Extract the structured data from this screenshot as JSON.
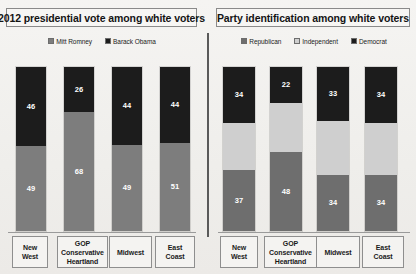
{
  "chart_data": [
    {
      "type": "bar",
      "subtype": "stacked-100",
      "title": "2012 presidential vote among white voters",
      "xlabel": "",
      "ylabel": "",
      "ylim": [
        0,
        100
      ],
      "grid": false,
      "legend_position": "top-center",
      "categories": [
        "New West",
        "GOP Conservative Heartland",
        "Midwest",
        "East Coast"
      ],
      "series": [
        {
          "name": "Mitt Romney",
          "color": "#7d7d7d",
          "values": [
            49,
            68,
            49,
            51
          ]
        },
        {
          "name": "Barack Obama",
          "color": "#1c1c1c",
          "values": [
            46,
            26,
            44,
            44
          ]
        }
      ],
      "stack_order_top_to_bottom": [
        "Barack Obama",
        "Mitt Romney"
      ]
    },
    {
      "type": "bar",
      "subtype": "stacked-100",
      "title": "Party identification among white voters",
      "xlabel": "",
      "ylabel": "",
      "ylim": [
        0,
        100
      ],
      "grid": false,
      "legend_position": "top-center",
      "categories": [
        "New West",
        "GOP Conservative Heartland",
        "Midwest",
        "East Coast"
      ],
      "series": [
        {
          "name": "Republican",
          "color": "#6e6e6e",
          "values": [
            37,
            48,
            34,
            34
          ]
        },
        {
          "name": "Independent",
          "color": "#cfcfcf",
          "values": [
            29,
            30,
            33,
            32
          ]
        },
        {
          "name": "Democrat",
          "color": "#1c1c1c",
          "values": [
            34,
            22,
            33,
            34
          ]
        }
      ],
      "stack_order_top_to_bottom": [
        "Democrat",
        "Independent",
        "Republican"
      ]
    }
  ],
  "panels": [
    {
      "title": "2012 presidential vote among white voters",
      "legend": [
        {
          "label": "Mitt Romney",
          "color": "#7d7d7d"
        },
        {
          "label": "Barack Obama",
          "color": "#1c1c1c"
        }
      ],
      "bars": [
        {
          "category_lines": [
            "New",
            "West"
          ],
          "segments": [
            {
              "series": "Barack Obama",
              "value": 46,
              "label": "46",
              "color": "#1c1c1c",
              "tone": "dark"
            },
            {
              "series": "Mitt Romney",
              "value": 49,
              "label": "49",
              "color": "#7d7d7d",
              "tone": "mid"
            }
          ]
        },
        {
          "category_lines": [
            "GOP",
            "Conservative",
            "Heartland"
          ],
          "segments": [
            {
              "series": "Barack Obama",
              "value": 26,
              "label": "26",
              "color": "#1c1c1c",
              "tone": "dark"
            },
            {
              "series": "Mitt Romney",
              "value": 68,
              "label": "68",
              "color": "#7d7d7d",
              "tone": "mid"
            }
          ]
        },
        {
          "category_lines": [
            "Midwest"
          ],
          "segments": [
            {
              "series": "Barack Obama",
              "value": 44,
              "label": "44",
              "color": "#1c1c1c",
              "tone": "dark"
            },
            {
              "series": "Mitt Romney",
              "value": 49,
              "label": "49",
              "color": "#7d7d7d",
              "tone": "mid"
            }
          ]
        },
        {
          "category_lines": [
            "East",
            "Coast"
          ],
          "segments": [
            {
              "series": "Barack Obama",
              "value": 44,
              "label": "44",
              "color": "#1c1c1c",
              "tone": "dark"
            },
            {
              "series": "Mitt Romney",
              "value": 51,
              "label": "51",
              "color": "#7d7d7d",
              "tone": "mid"
            }
          ]
        }
      ]
    },
    {
      "title": "Party identification among white voters",
      "legend": [
        {
          "label": "Republican",
          "color": "#6e6e6e"
        },
        {
          "label": "Independent",
          "color": "#cfcfcf"
        },
        {
          "label": "Democrat",
          "color": "#1c1c1c"
        }
      ],
      "bars": [
        {
          "category_lines": [
            "New",
            "West"
          ],
          "segments": [
            {
              "series": "Democrat",
              "value": 34,
              "label": "34",
              "color": "#1c1c1c",
              "tone": "dark"
            },
            {
              "series": "Independent",
              "value": 29,
              "label": "",
              "color": "#cfcfcf",
              "tone": "light"
            },
            {
              "series": "Republican",
              "value": 37,
              "label": "37",
              "color": "#6e6e6e",
              "tone": "mid"
            }
          ]
        },
        {
          "category_lines": [
            "GOP",
            "Conservative",
            "Heartland"
          ],
          "segments": [
            {
              "series": "Democrat",
              "value": 22,
              "label": "22",
              "color": "#1c1c1c",
              "tone": "dark"
            },
            {
              "series": "Independent",
              "value": 30,
              "label": "",
              "color": "#cfcfcf",
              "tone": "light"
            },
            {
              "series": "Republican",
              "value": 48,
              "label": "48",
              "color": "#6e6e6e",
              "tone": "mid"
            }
          ]
        },
        {
          "category_lines": [
            "Midwest"
          ],
          "segments": [
            {
              "series": "Democrat",
              "value": 33,
              "label": "33",
              "color": "#1c1c1c",
              "tone": "dark"
            },
            {
              "series": "Independent",
              "value": 33,
              "label": "",
              "color": "#cfcfcf",
              "tone": "light"
            },
            {
              "series": "Republican",
              "value": 34,
              "label": "34",
              "color": "#6e6e6e",
              "tone": "mid"
            }
          ]
        },
        {
          "category_lines": [
            "East",
            "Coast"
          ],
          "segments": [
            {
              "series": "Democrat",
              "value": 34,
              "label": "34",
              "color": "#1c1c1c",
              "tone": "dark"
            },
            {
              "series": "Independent",
              "value": 32,
              "label": "",
              "color": "#cfcfcf",
              "tone": "light"
            },
            {
              "series": "Republican",
              "value": 34,
              "label": "34",
              "color": "#6e6e6e",
              "tone": "mid"
            }
          ]
        }
      ]
    }
  ]
}
